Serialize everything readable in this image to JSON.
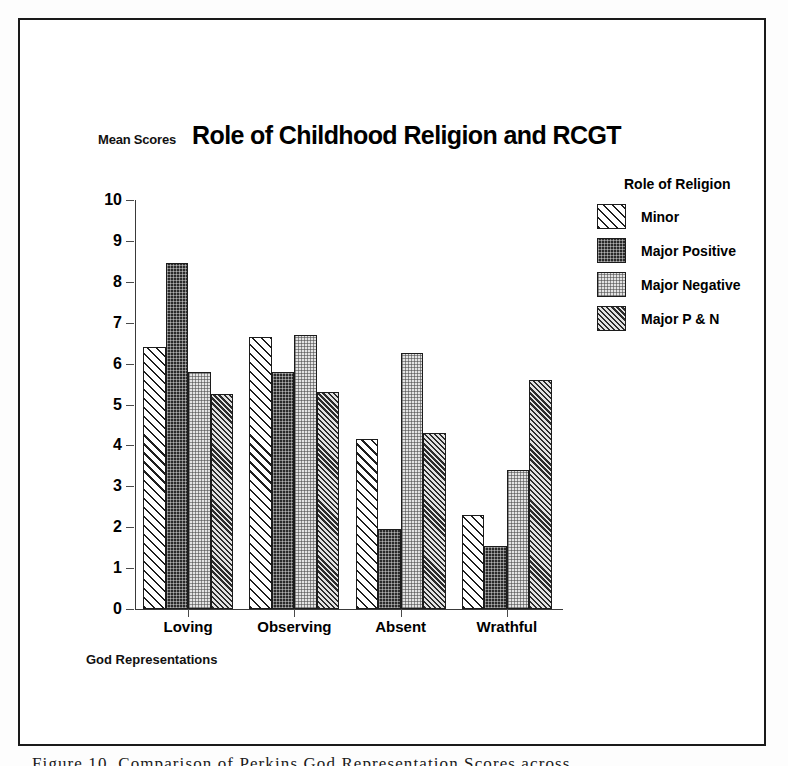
{
  "figure": {
    "title": "Role of Childhood Religion and RCGT",
    "y_axis_caption": "Mean Scores",
    "x_axis_caption": "God Representations",
    "caption_fragment": "Figure 10. Comparison of Perkins God Representation Scores across"
  },
  "legend": {
    "title": "Role of Religion",
    "items": [
      {
        "label": "Minor",
        "pattern": "diagonal-hatch-white",
        "swatch_class": "p-minor"
      },
      {
        "label": "Major Positive",
        "pattern": "dark-checker",
        "swatch_class": "p-majpos"
      },
      {
        "label": "Major Negative",
        "pattern": "light-dotted",
        "swatch_class": "p-majneg"
      },
      {
        "label": "Major P & N",
        "pattern": "gray-diagonal-hatch",
        "swatch_class": "p-majpn"
      }
    ]
  },
  "chart_data": {
    "type": "bar",
    "title": "Role of Childhood Religion and RCGT",
    "xlabel": "God Representations",
    "ylabel": "Mean Scores",
    "ylim": [
      0,
      10
    ],
    "yticks": [
      0,
      1,
      2,
      3,
      4,
      5,
      6,
      7,
      8,
      9,
      10
    ],
    "grid": false,
    "legend_position": "right",
    "legend_title": "Role of Religion",
    "categories": [
      "Loving",
      "Observing",
      "Absent",
      "Wrathful"
    ],
    "series": [
      {
        "name": "Minor",
        "values": [
          6.4,
          6.65,
          4.15,
          2.3
        ]
      },
      {
        "name": "Major Positive",
        "values": [
          8.45,
          5.8,
          1.95,
          1.55
        ]
      },
      {
        "name": "Major Negative",
        "values": [
          5.8,
          6.7,
          6.25,
          3.4
        ]
      },
      {
        "name": "Major P & N",
        "values": [
          5.25,
          5.3,
          4.3,
          5.6
        ]
      }
    ]
  }
}
